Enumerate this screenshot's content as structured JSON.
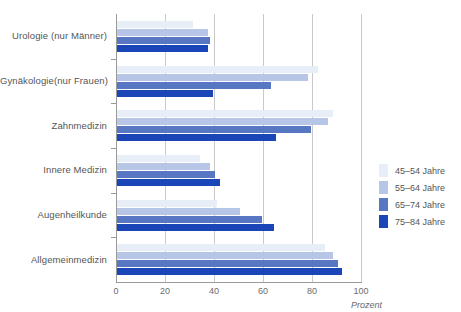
{
  "chart_data": {
    "type": "bar",
    "orientation": "horizontal",
    "title": "",
    "xlabel": "Prozent",
    "ylabel": "",
    "xlim": [
      0,
      100
    ],
    "xticks": [
      "0",
      "20",
      "40",
      "60",
      "80",
      "100"
    ],
    "xtick_values": [
      0,
      20,
      40,
      60,
      80,
      100
    ],
    "grid": "vertical",
    "legend_position": "right",
    "categories": [
      "Urologie (nur Männer)",
      "Gynäkologie(nur Frauen)",
      "Zahnmedizin",
      "Innere Medizin",
      "Augenheilkunde",
      "Allgemeinmedizin"
    ],
    "series": [
      {
        "name": "45–54 Jahre",
        "color": "#e8eef8",
        "values": [
          31,
          82,
          88,
          34,
          41,
          85
        ]
      },
      {
        "name": "55–64 Jahre",
        "color": "#b7c6e6",
        "values": [
          37,
          78,
          86,
          38,
          50,
          88
        ]
      },
      {
        "name": "65–74 Jahre",
        "color": "#5877c2",
        "values": [
          38,
          63,
          79,
          40,
          59,
          90
        ]
      },
      {
        "name": "75–84 Jahre",
        "color": "#1a46b8",
        "values": [
          37,
          39,
          65,
          42,
          64,
          92
        ]
      }
    ]
  },
  "legend": {
    "items": [
      {
        "label": "45–54 Jahre",
        "color": "#e8eef8"
      },
      {
        "label": "55–64 Jahre",
        "color": "#b7c6e6"
      },
      {
        "label": "65–74 Jahre",
        "color": "#5877c2"
      },
      {
        "label": "75–84 Jahre",
        "color": "#1a46b8"
      }
    ]
  },
  "axis": {
    "x_title": "Prozent"
  },
  "top_strip_text": ""
}
